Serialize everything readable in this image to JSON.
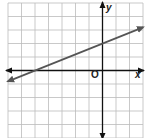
{
  "chart_data": {
    "type": "line",
    "title": "",
    "xlabel": "x",
    "ylabel": "y",
    "origin_label": "O",
    "xlim": [
      -7,
      3
    ],
    "ylim": [
      -5,
      5
    ],
    "grid": true,
    "ticks_labeled": false,
    "series": [
      {
        "name": "line",
        "equation": "y = (2/5)x + 2",
        "slope": 0.4,
        "y_intercept": 2,
        "x_intercept": -5,
        "x": [
          -7,
          3
        ],
        "y": [
          -0.8,
          3.2
        ],
        "arrows": "both",
        "color": "#555555"
      }
    ]
  },
  "labels": {
    "x_axis": "x",
    "y_axis": "y",
    "origin": "O"
  },
  "colors": {
    "grid": "#bbbbbb",
    "axis": "#111111",
    "line": "#555555"
  }
}
